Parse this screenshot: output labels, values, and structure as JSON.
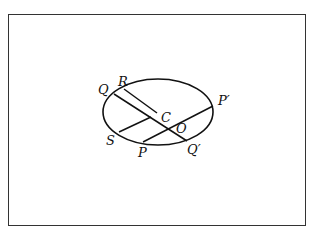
{
  "diagram": {
    "type": "ellipse-conjugate-diameters",
    "ellipse": {
      "cx": 158,
      "cy": 112,
      "rx": 55,
      "ry": 33
    },
    "points": [
      {
        "name": "Q",
        "label": "Q",
        "x": 114,
        "y": 94,
        "lx": 98,
        "ly": 94
      },
      {
        "name": "R",
        "label": "R",
        "x": 124,
        "y": 89,
        "lx": 118,
        "ly": 86
      },
      {
        "name": "C",
        "label": "C",
        "x": 157,
        "y": 113,
        "lx": 161,
        "ly": 122
      },
      {
        "name": "S",
        "label": "S",
        "x": 119,
        "y": 132,
        "lx": 106,
        "ly": 145
      },
      {
        "name": "P",
        "label": "P",
        "x": 143,
        "y": 142,
        "lx": 138,
        "ly": 157
      },
      {
        "name": "Q-prime",
        "label": "Q′",
        "x": 187,
        "y": 141,
        "lx": 187,
        "ly": 154
      },
      {
        "name": "P-prime",
        "label": "P′",
        "x": 213,
        "y": 106,
        "lx": 218,
        "ly": 105
      },
      {
        "name": "O",
        "label": "O",
        "x": 170,
        "y": 129,
        "lx": 176,
        "ly": 133
      }
    ],
    "segments": [
      {
        "name": "segment-RC",
        "x1": 124,
        "y1": 89,
        "x2": 157,
        "y2": 113
      },
      {
        "name": "segment-QQ-prime",
        "x1": 114,
        "y1": 94,
        "x2": 187,
        "y2": 141
      },
      {
        "name": "segment-S-to-QQ",
        "x1": 119,
        "y1": 132,
        "x2": 151,
        "y2": 117
      },
      {
        "name": "segment-PP-prime",
        "x1": 143,
        "y1": 142,
        "x2": 213,
        "y2": 106
      }
    ]
  }
}
